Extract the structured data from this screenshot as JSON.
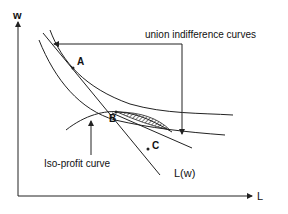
{
  "axes": {
    "y_label": "w",
    "x_label": "L"
  },
  "labels": {
    "union_curves": "union indifference curves",
    "iso_profit": "Iso-profit curve",
    "labor_demand": "L(w)"
  },
  "points": {
    "a": "A",
    "b": "B",
    "c": "C"
  },
  "colors": {
    "line": "#222222",
    "background": "#ffffff"
  }
}
